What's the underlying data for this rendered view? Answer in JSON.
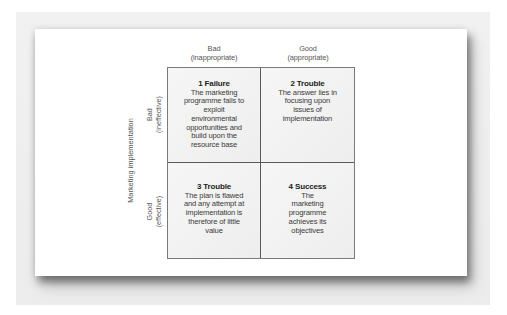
{
  "diagram": {
    "type": "2x2 matrix",
    "y_axis_label": "Marketing implementation",
    "columns": [
      {
        "label": "Bad",
        "sublabel": "(inappropriate)"
      },
      {
        "label": "Good",
        "sublabel": "(appropriate)"
      }
    ],
    "rows": [
      {
        "label": "Bad",
        "sublabel": "(ineffective)"
      },
      {
        "label": "Good",
        "sublabel": "(effective)"
      }
    ],
    "cells": [
      {
        "title": "1 Failure",
        "body": "The marketing programme fails to exploit environmental opportunities and build upon the resource base"
      },
      {
        "title": "2 Trouble",
        "body": "The answer lies in focusing upon issues of implementation"
      },
      {
        "title": "3 Trouble",
        "body": "The plan is flawed and any attempt at implementation is therefore of little value"
      },
      {
        "title": "4 Success",
        "body": "The marketing programme achieves its objectives"
      }
    ]
  },
  "colors": {
    "frame_background": "#ececec",
    "card_background": "#ffffff",
    "cell_background": "#f2f2f2",
    "grid_line": "#5a5a5a",
    "text": "#3a3a3a"
  }
}
